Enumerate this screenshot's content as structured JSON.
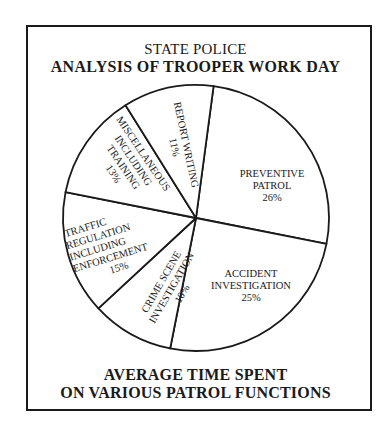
{
  "header": {
    "title_line1": "STATE POLICE",
    "title_line2": "ANALYSIS OF TROOPER WORK DAY"
  },
  "footer": {
    "caption_line1": "AVERAGE TIME SPENT",
    "caption_line2": "ON VARIOUS PATROL FUNCTIONS"
  },
  "slices": [
    {
      "lines": [
        "PREVENTIVE",
        "PATROL"
      ],
      "pct": "26%"
    },
    {
      "lines": [
        "ACCIDENT",
        "INVESTIGATION"
      ],
      "pct": "25%"
    },
    {
      "lines": [
        "CRIME SCENE",
        "INVESTIGATION"
      ],
      "pct": "10%"
    },
    {
      "lines": [
        "TRAFFIC",
        "REGULATION",
        "INCLUDING",
        "ENFORCEMENT"
      ],
      "pct": "15%"
    },
    {
      "lines": [
        "MISCELLANEOUS",
        "INCLUDING",
        "TRAINING"
      ],
      "pct": "13%"
    },
    {
      "lines": [
        "REPORT WRITING"
      ],
      "pct": "11%"
    }
  ],
  "colors": {
    "ink": "#1a1a1a",
    "background": "#ffffff"
  },
  "chart_data": {
    "type": "pie",
    "subtitle": "AVERAGE TIME SPENT ON VARIOUS PATROL FUNCTIONS",
    "categories": [
      "Preventive Patrol",
      "Accident Investigation",
      "Crime Scene Investigation",
      "Traffic Regulation Including Enforcement",
      "Miscellaneous Including Training",
      "Report Writing"
    ],
    "values": [
      26,
      25,
      10,
      15,
      13,
      11
    ],
    "unit": "%",
    "start_angle_deg_clockwise_from_top": 7.6,
    "legend": "none (labels inside slices)",
    "fill": "none (white slices, black outlines)"
  }
}
